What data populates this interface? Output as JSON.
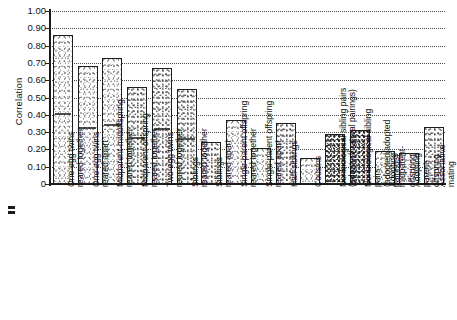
{
  "chart_data": {
    "type": "bar",
    "title": "",
    "xlabel": "",
    "ylabel": "Correlation",
    "ylim": [
      0,
      1.0
    ],
    "ytick_labels": [
      "1.00",
      "0.90",
      "0.80",
      "0.70",
      "0.60",
      "0.50",
      "0.40",
      "0.30",
      "0.20",
      "0.10",
      "0"
    ],
    "ytick_values": [
      1.0,
      0.9,
      0.8,
      0.7,
      0.6,
      0.5,
      0.4,
      0.3,
      0.2,
      0.1,
      0
    ],
    "grid": true,
    "grid_style": "dotted-horizontal",
    "legend": "none",
    "categories": [
      "One-egg twins\nreared together",
      "One-egg twins\nreared apart",
      "Midparent-midoffspring\nreared together",
      "Midparent-offspring\nreared together",
      "Two-egg twins\nreared together",
      "Siblings\nreared together",
      "Siblings\nreared apart",
      "Single-parent offspring\nreared together",
      "Single-parent offspring\nreared apart",
      "Half-siblings",
      "Cousins",
      "Nonbiological sibling pairs\n(adopted/natural pairings)",
      "Nonbiological sibling pairs\n(adopted/adopted pairings)",
      "Adopting\nmidparent-offspring",
      "Adopting\nparent-offspring",
      "Assortative mating"
    ],
    "values": [
      0.86,
      0.68,
      0.73,
      0.56,
      0.67,
      0.55,
      0.24,
      0.37,
      0.21,
      0.35,
      0.15,
      0.29,
      0.31,
      0.19,
      0.18,
      0.33
    ]
  }
}
